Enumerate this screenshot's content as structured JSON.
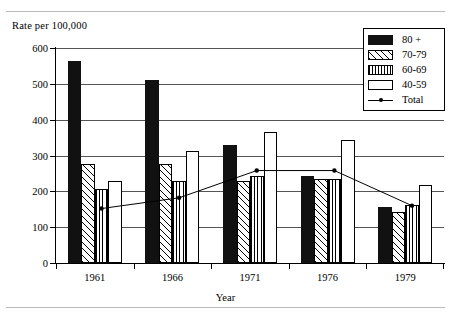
{
  "chart_data": {
    "type": "bar",
    "title": "",
    "xlabel": "Year",
    "ylabel": "Rate per 100,000",
    "categories": [
      "1961",
      "1966",
      "1971",
      "1976",
      "1979"
    ],
    "ylim": [
      0,
      600
    ],
    "yticks": [
      0,
      100,
      200,
      300,
      400,
      500,
      600
    ],
    "ytick_labels": [
      "0",
      "100",
      "200",
      "300",
      "400",
      "500",
      "600"
    ],
    "grid": true,
    "legend_position": "top-right",
    "series": [
      {
        "name": "80 +",
        "pattern": "solid-black",
        "values": [
          565,
          510,
          330,
          243,
          155
        ]
      },
      {
        "name": "70-79",
        "pattern": "diagonal-hatch",
        "values": [
          277,
          277,
          228,
          235,
          142
        ]
      },
      {
        "name": "60-69",
        "pattern": "vertical-stripes",
        "values": [
          207,
          228,
          243,
          235,
          162
        ]
      },
      {
        "name": "40-59",
        "pattern": "white-empty",
        "values": [
          228,
          312,
          365,
          343,
          218
        ]
      }
    ],
    "overlay": {
      "name": "Total",
      "type": "line",
      "marker": "dot",
      "values": [
        152,
        182,
        258,
        258,
        160
      ]
    }
  },
  "legend": {
    "entries": [
      {
        "label": "80 +",
        "swatch": "solid-black"
      },
      {
        "label": "70-79",
        "swatch": "diagonal-hatch"
      },
      {
        "label": "60-69",
        "swatch": "vertical-stripes"
      },
      {
        "label": "40-59",
        "swatch": "white-empty"
      },
      {
        "label": "Total",
        "swatch": "line-with-dot"
      }
    ]
  }
}
